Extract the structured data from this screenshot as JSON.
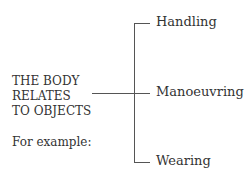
{
  "diagram": {
    "root": {
      "lines": [
        "THE BODY",
        "RELATES",
        "TO OBJECTS"
      ]
    },
    "caption": "For example:",
    "branches": [
      {
        "label": "Handling"
      },
      {
        "label": "Manoeuvring"
      },
      {
        "label": "Wearing"
      }
    ],
    "line_color": "#555555"
  }
}
